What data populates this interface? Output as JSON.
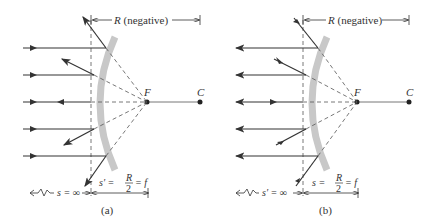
{
  "panels": [
    {
      "id": "a",
      "caption": "(a)",
      "radius_label_var": "R",
      "radius_label_note": " (negative)",
      "focal_label": "F",
      "center_label": "C",
      "object_distance_label": "s = ∞",
      "image_distance_var": "s′ =",
      "image_distance_num": "R",
      "image_distance_den": "2",
      "image_distance_tail": "= f",
      "description": "Parallel rays incident from left on convex mirror; reflected rays diverge as if from focal point F"
    },
    {
      "id": "b",
      "caption": "(b)",
      "radius_label_var": "R",
      "radius_label_note": " (negative)",
      "focal_label": "F",
      "center_label": "C",
      "object_distance_label": "s′ = ∞",
      "image_distance_var": "s =",
      "image_distance_num": "R",
      "image_distance_den": "2",
      "image_distance_tail": "= f",
      "description": "Rays converging toward F reflect off convex mirror as parallel rays"
    }
  ],
  "colors": {
    "mirror": "#c8c8c8",
    "ray": "#333333",
    "dashed": "#555555"
  }
}
